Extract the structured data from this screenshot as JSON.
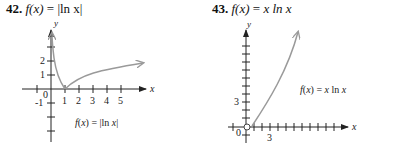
{
  "problems": [
    {
      "number": "42.",
      "func_label": "f(x) = |ln x|",
      "title_func": "f(x)",
      "title_eq": " = ",
      "title_expr": "|ln x|",
      "graph": {
        "x_axis_label": "x",
        "y_axis_label": "y",
        "x_ticks": [
          "1",
          "2",
          "3",
          "4",
          "5"
        ],
        "y_ticks": [
          "1",
          "2"
        ],
        "neg_label": "-1",
        "origin_label": "0",
        "curve_label": "f(x) = |ln x|"
      }
    },
    {
      "number": "43.",
      "func_label": "f(x) = x ln x",
      "title_func": "f(x)",
      "title_eq": " = ",
      "title_expr": "x ln x",
      "graph": {
        "x_axis_label": "x",
        "y_axis_label": "y",
        "x_ticks": [
          "3"
        ],
        "y_ticks": [
          "3"
        ],
        "origin_label": "0",
        "curve_label": "f(x) = x ln x"
      }
    }
  ],
  "colors": {
    "curve": "#9a9a9a",
    "axis": "#222222"
  }
}
